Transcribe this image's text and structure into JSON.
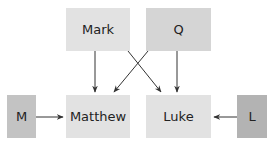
{
  "diagram": {
    "nodes": [
      {
        "id": "mark",
        "label": "Mark",
        "x": 66,
        "y": 8,
        "w": 64,
        "h": 43,
        "color": "#e2e2e2"
      },
      {
        "id": "q",
        "label": "Q",
        "x": 146,
        "y": 8,
        "w": 65,
        "h": 43,
        "color": "#d5d5d5"
      },
      {
        "id": "m",
        "label": "M",
        "x": 7,
        "y": 95,
        "w": 29,
        "h": 43,
        "color": "#c3c3c3"
      },
      {
        "id": "matthew",
        "label": "Matthew",
        "x": 66,
        "y": 95,
        "w": 64,
        "h": 43,
        "color": "#e2e2e2"
      },
      {
        "id": "luke",
        "label": "Luke",
        "x": 146,
        "y": 95,
        "w": 65,
        "h": 43,
        "color": "#e2e2e2"
      },
      {
        "id": "l",
        "label": "L",
        "x": 237,
        "y": 95,
        "w": 30,
        "h": 43,
        "color": "#b3b3b3"
      }
    ],
    "edges": [
      {
        "from": "Mark",
        "to": "Matthew"
      },
      {
        "from": "Mark",
        "to": "Luke"
      },
      {
        "from": "Q",
        "to": "Matthew"
      },
      {
        "from": "Q",
        "to": "Luke"
      },
      {
        "from": "M",
        "to": "Matthew"
      },
      {
        "from": "L",
        "to": "Luke"
      }
    ],
    "arrow_color": "#333333"
  }
}
